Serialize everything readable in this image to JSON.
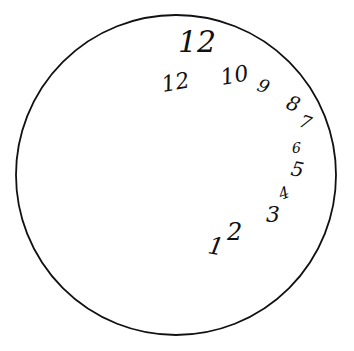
{
  "drawing": {
    "type": "clock-drawing",
    "stroke_color": "#111111",
    "background": "#ffffff",
    "circle": {
      "cx": 176,
      "cy": 175,
      "r": 160
    },
    "top_label": "12",
    "numbers": [
      {
        "text": "12",
        "x": 163,
        "y": 92,
        "size": 22,
        "rot": -10
      },
      {
        "text": "10",
        "x": 222,
        "y": 85,
        "size": 22,
        "rot": -10
      },
      {
        "text": "9",
        "x": 256,
        "y": 90,
        "size": 18,
        "rot": 20
      },
      {
        "text": "8",
        "x": 285,
        "y": 108,
        "size": 20,
        "rot": 20
      },
      {
        "text": "7",
        "x": 298,
        "y": 126,
        "size": 18,
        "rot": 20
      },
      {
        "text": "6",
        "x": 292,
        "y": 153,
        "size": 14,
        "rot": 0
      },
      {
        "text": "5",
        "x": 290,
        "y": 175,
        "size": 20,
        "rot": 10
      },
      {
        "text": "4",
        "x": 281,
        "y": 200,
        "size": 16,
        "rot": -20
      },
      {
        "text": "3",
        "x": 266,
        "y": 222,
        "size": 22,
        "rot": 0
      },
      {
        "text": "2",
        "x": 227,
        "y": 240,
        "size": 24,
        "rot": 0
      },
      {
        "text": "1",
        "x": 207,
        "y": 253,
        "size": 24,
        "rot": 10
      }
    ]
  }
}
